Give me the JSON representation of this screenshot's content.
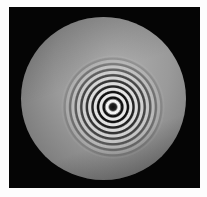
{
  "image": {
    "subject": "circular interference fringe pattern (concentric rings) in a round aperture",
    "colors": {
      "background": "#fdfdfd",
      "frame": "#050505",
      "disc": "#9a9a9a",
      "fringe_light": "#e8e8e8",
      "fringe_dark": "#111111"
    }
  }
}
